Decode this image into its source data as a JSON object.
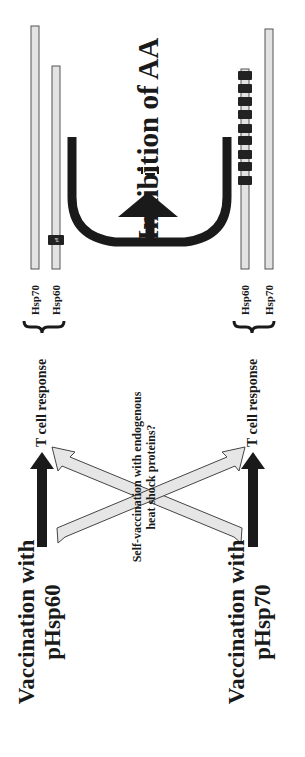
{
  "diagram": {
    "orientation": "rotated 90° counter-clockwise",
    "vaccination": {
      "hsp60": {
        "line1": "Vaccination with",
        "line2": "pHsp60"
      },
      "hsp70": {
        "line1": "Vaccination with",
        "line2": "pHsp70"
      }
    },
    "t_cell_response": {
      "top": "T cell response",
      "bottom": "T cell response"
    },
    "self_vaccination": {
      "line1": "Self-vaccination with endogenous",
      "line2": "heat shock proteins?"
    },
    "outcome": "Inhibition of AA",
    "protein_bars": {
      "top": [
        {
          "label": "Hsp70",
          "epitopes": []
        },
        {
          "label": "Hsp60",
          "epitopes": [
            "p8"
          ]
        }
      ],
      "bottom": [
        {
          "label": "Hsp60",
          "epitopes": [
            "1",
            "2",
            "3",
            "4",
            "5",
            "6",
            "7",
            "8",
            "9"
          ]
        },
        {
          "label": "Hsp70",
          "epitopes": []
        }
      ]
    },
    "colors": {
      "arrow_solid": "#1a1a1a",
      "arrow_hollow_fill": "#e6e6e6",
      "bar_fill": "#e3e3e3",
      "bar_stroke": "#555555",
      "epitope_fill": "#222222"
    }
  }
}
